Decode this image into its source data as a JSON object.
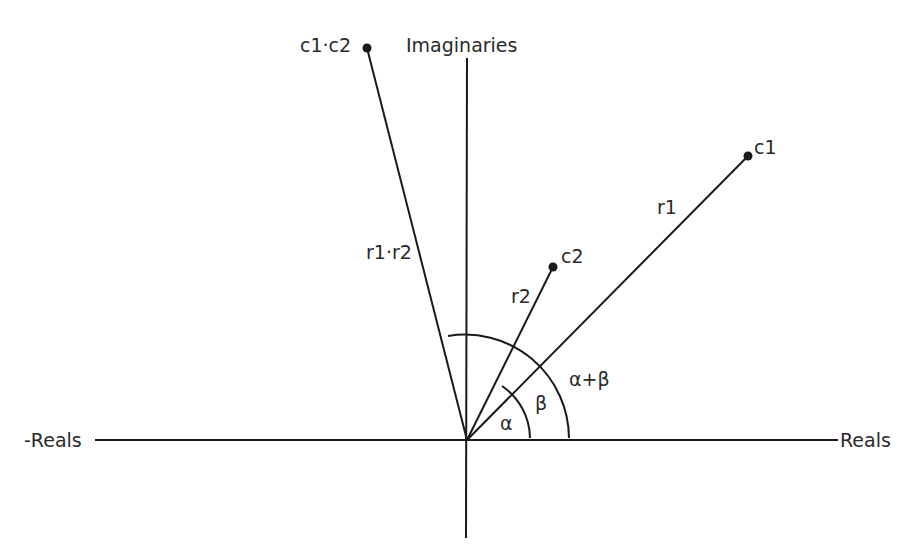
{
  "diagram": {
    "axes": {
      "real_positive": "Reals",
      "real_negative": "-Reals",
      "imaginary": "Imaginaries"
    },
    "points": [
      {
        "id": "c1",
        "label": "c1",
        "radius_label": "r1"
      },
      {
        "id": "c2",
        "label": "c2",
        "radius_label": "r2"
      },
      {
        "id": "c1c2",
        "label": "c1·c2",
        "radius_label": "r1·r2"
      }
    ],
    "angles": {
      "alpha": "α",
      "beta": "β",
      "sum": "α+β"
    },
    "colors": {
      "line": "#1a1a1a",
      "text": "#2a2a2a",
      "background": "#ffffff"
    }
  }
}
